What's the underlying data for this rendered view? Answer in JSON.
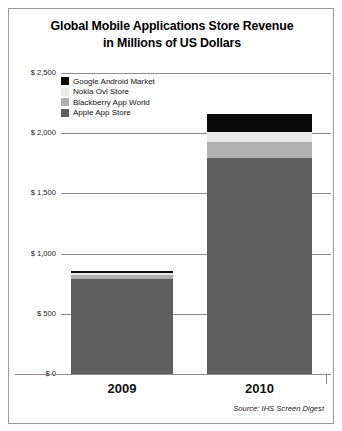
{
  "chart_data": {
    "type": "bar",
    "stacked": true,
    "title": "Global Mobile Applications Store Revenue in Millions of US Dollars",
    "title_lines": [
      "Global Mobile Applications Store Revenue",
      "in Millions of US Dollars"
    ],
    "xlabel": "",
    "ylabel": "",
    "ylim": [
      0,
      2500
    ],
    "grid": true,
    "grid_axis": "y",
    "legend_position": "inside-top-left",
    "categories": [
      "2009",
      "2010"
    ],
    "ticks": [
      {
        "value": 2500,
        "label": "$ 2,500"
      },
      {
        "value": 2000,
        "label": "$ 2,000"
      },
      {
        "value": 1500,
        "label": "$ 1,500"
      },
      {
        "value": 1000,
        "label": "$ 1,000"
      },
      {
        "value": 500,
        "label": "$ 500"
      },
      {
        "value": 0,
        "label": "$ 0"
      }
    ],
    "series": [
      {
        "name": "Google Android Market",
        "color": "#0a0a0a",
        "values": [
          15,
          150
        ]
      },
      {
        "name": "Nokia Ovi Store",
        "color": "#e8e8e8",
        "values": [
          17,
          83
        ]
      },
      {
        "name": "Blackberry App World",
        "color": "#b0b0b0",
        "values": [
          33,
          133
        ]
      },
      {
        "name": "Apple App Store",
        "color": "#5e5e5e",
        "values": [
          790,
          1795
        ]
      }
    ],
    "stack_order_top_to_bottom": [
      "Google Android Market",
      "Nokia Ovi Store",
      "Blackberry App World",
      "Apple App Store"
    ],
    "totals": [
      855,
      2158
    ],
    "annotations": [
      "Source: IHS Screen Digest"
    ]
  },
  "legend": {
    "items": [
      {
        "label": "Google Android Market"
      },
      {
        "label": "Nokia Ovi Store"
      },
      {
        "label": "Blackberry App World"
      },
      {
        "label": "Apple App Store"
      }
    ]
  },
  "source": {
    "text": "Source: IHS Screen Digest"
  },
  "colors": {
    "android": "#0a0a0a",
    "nokia": "#e8e8e8",
    "blackberry": "#b0b0b0",
    "apple": "#5e5e5e",
    "grid": "#8d8d8d",
    "border": "#9a9a9a",
    "text": "#111111"
  }
}
